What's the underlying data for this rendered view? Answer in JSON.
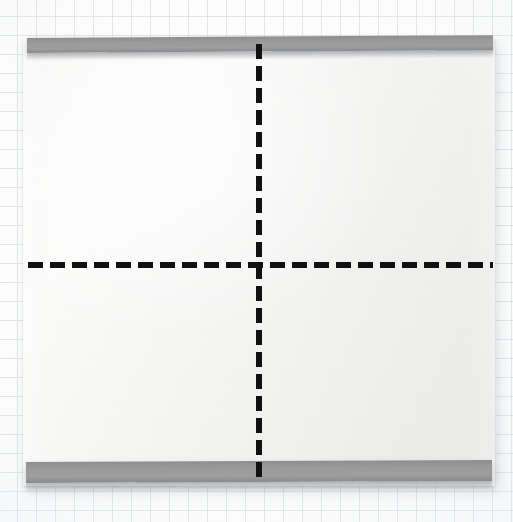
{
  "scene": {
    "title": "Folded paper sheet on graph paper",
    "description": "Photograph of a white sheet of paper with grey binder strips along the top and bottom edges, resting on pale blue graph paper. Two bold black dashed lines cross at the centre marking the fold axes.",
    "width_px": 513,
    "height_px": 522
  },
  "background": {
    "name": "graph-paper",
    "paper_color": "#fdfdfd",
    "grid_line_color": "#ced6de",
    "grid_spacing_px": 19
  },
  "sheet": {
    "name": "paper-sheet",
    "fill_color": "#f4f4f3",
    "left_px": 23,
    "top_px": 39,
    "width_px": 472,
    "height_px": 447,
    "shadow_color": "#78808880"
  },
  "strips": [
    {
      "name": "top-binder-strip",
      "position": "top",
      "color": "#9b9b9b",
      "left_px": 27,
      "top_px": 38,
      "width_px": 466,
      "height_px": 15
    },
    {
      "name": "bottom-binder-strip",
      "position": "bottom",
      "color": "#9b9b9b",
      "left_px": 26,
      "top_px": 462,
      "width_px": 466,
      "height_px": 21
    }
  ],
  "fold_lines": [
    {
      "name": "horizontal-fold-line",
      "orientation": "horizontal",
      "color": "#111111",
      "thickness_px": 6,
      "dash_length_px": 15,
      "gap_length_px": 7,
      "start_px": 28,
      "end_px": 493,
      "axis_px": 265
    },
    {
      "name": "vertical-fold-line",
      "orientation": "vertical",
      "color": "#111111",
      "thickness_px": 6,
      "dash_length_px": 15,
      "gap_length_px": 7,
      "start_px": 44,
      "end_px": 481,
      "axis_px": 259
    }
  ],
  "crosshair": {
    "name": "fold-intersection",
    "x_px": 259,
    "y_px": 265
  }
}
